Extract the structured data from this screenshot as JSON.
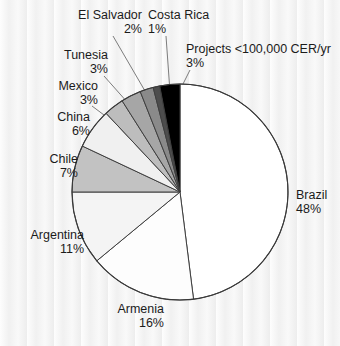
{
  "chart_data": {
    "type": "pie",
    "title": "",
    "subtitle": "",
    "legend_position": "outside-labels",
    "grid": false,
    "start_angle_deg": 0,
    "direction": "clockwise",
    "labels": [
      "Brazil",
      "Armenia",
      "Argentina",
      "Chile",
      "China",
      "Mexico",
      "Tunesia",
      "El Salvador",
      "Costa Rica",
      "Projects <100,000 CER/yr"
    ],
    "values": [
      48,
      16,
      11,
      7,
      6,
      3,
      3,
      2,
      1,
      3
    ],
    "unit": "%",
    "slices": [
      {
        "name": "Brazil",
        "value": 48,
        "percent_label": "48%",
        "color": "#ffffff"
      },
      {
        "name": "Armenia",
        "value": 16,
        "percent_label": "16%",
        "color": "#fdfdfd"
      },
      {
        "name": "Argentina",
        "value": 11,
        "percent_label": "11%",
        "color": "#f4f4f4"
      },
      {
        "name": "Chile",
        "value": 7,
        "percent_label": "7%",
        "color": "#c2c2c2"
      },
      {
        "name": "China",
        "value": 6,
        "percent_label": "6%",
        "color": "#f0f0f0"
      },
      {
        "name": "Mexico",
        "value": 3,
        "percent_label": "3%",
        "color": "#bdbdbd"
      },
      {
        "name": "Tunesia",
        "value": 3,
        "percent_label": "3%",
        "color": "#a6a6a6"
      },
      {
        "name": "El Salvador",
        "value": 2,
        "percent_label": "2%",
        "color": "#8a8a8a"
      },
      {
        "name": "Costa Rica",
        "value": 1,
        "percent_label": "1%",
        "color": "#4d4d4d"
      },
      {
        "name": "Projects <100,000 CER/yr",
        "value": 3,
        "percent_label": "3%",
        "color": "#000000"
      }
    ]
  },
  "labels": {
    "brazil": {
      "name": "Brazil",
      "pct": "48%"
    },
    "armenia": {
      "name": "Armenia",
      "pct": "16%"
    },
    "argentina": {
      "name": "Argentina",
      "pct": "11%"
    },
    "chile": {
      "name": "Chile",
      "pct": "7%"
    },
    "china": {
      "name": "China",
      "pct": "6%"
    },
    "mexico": {
      "name": "Mexico",
      "pct": "3%"
    },
    "tunesia": {
      "name": "Tunesia",
      "pct": "3%"
    },
    "el_salvador": {
      "name": "El Salvador",
      "pct": "2%"
    },
    "costa_rica": {
      "name": "Costa Rica",
      "pct": "1%"
    },
    "projects": {
      "name": "Projects <100,000 CER/yr",
      "pct": "3%"
    }
  },
  "style": {
    "background": "#f3f3f3",
    "outline": "#3a3a3a",
    "text": "#1b1b1b"
  }
}
